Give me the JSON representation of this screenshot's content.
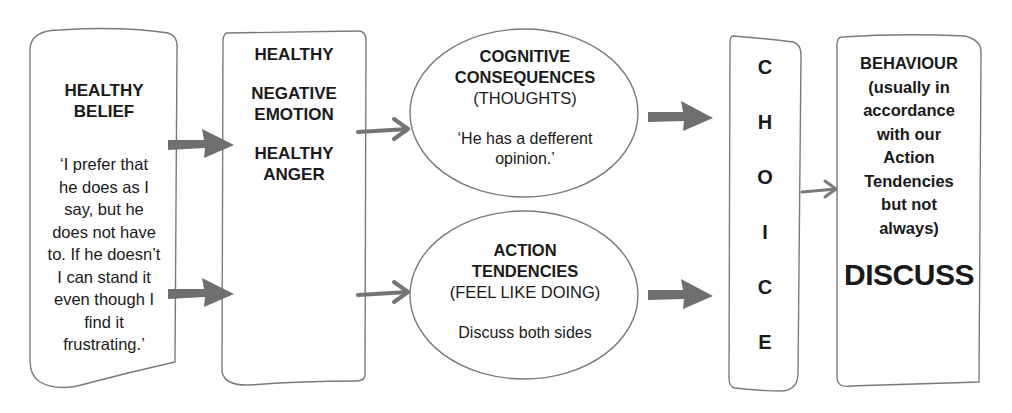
{
  "diagram": {
    "colors": {
      "outline": "#7a7a7a",
      "arrow": "#6f6f6f",
      "text": "#1a1a1a",
      "background": "#ffffff"
    },
    "belief_box": {
      "title_line1": "HEALTHY",
      "title_line2": "BELIEF",
      "quote_lines": [
        "‘I prefer that",
        "he does as I",
        "say, but he",
        "does not have",
        "to. If he doesn’t",
        "I can stand it",
        "even though I",
        "find it",
        "frustrating.’"
      ]
    },
    "emotion_box": {
      "line1": "HEALTHY",
      "line2": "NEGATIVE",
      "line3": "EMOTION",
      "line4": "HEALTHY",
      "line5": "ANGER"
    },
    "cognitive_oval": {
      "title_line1": "COGNITIVE",
      "title_line2": "CONSEQUENCES",
      "subtitle": "(THOUGHTS)",
      "body_line1": "‘He has a defferent",
      "body_line2": "opinion.’"
    },
    "action_oval": {
      "title_line1": "ACTION",
      "title_line2": "TENDENCIES",
      "subtitle": "(FEEL LIKE DOING)",
      "body": "Discuss both sides"
    },
    "choice_box": {
      "letters": [
        "C",
        "H",
        "O",
        "I",
        "C",
        "E"
      ]
    },
    "behaviour_box": {
      "lines": [
        "BEHAVIOUR",
        "(usually in",
        "accordance",
        "with our",
        "Action",
        "Tendencies",
        "but not",
        "always)"
      ],
      "emphasis": "DISCUSS"
    },
    "arrows": [
      {
        "from": "belief_box",
        "to": "emotion_box",
        "style": "thick"
      },
      {
        "from": "belief_box",
        "to": "emotion_box",
        "style": "thick"
      },
      {
        "from": "emotion_box",
        "to": "cognitive_oval",
        "style": "thin"
      },
      {
        "from": "emotion_box",
        "to": "action_oval",
        "style": "thin"
      },
      {
        "from": "cognitive_oval",
        "to": "choice_box",
        "style": "thick"
      },
      {
        "from": "action_oval",
        "to": "choice_box",
        "style": "thick"
      },
      {
        "from": "choice_box",
        "to": "behaviour_box",
        "style": "thin"
      }
    ]
  }
}
